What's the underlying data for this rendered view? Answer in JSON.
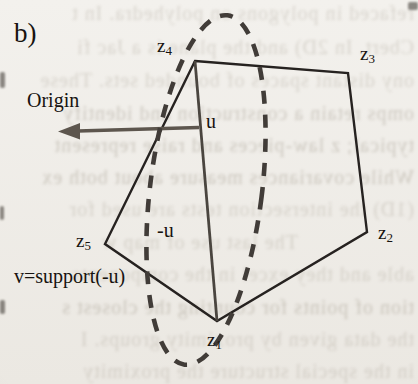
{
  "figure": {
    "panel_label": "b)",
    "origin_label": "Origin",
    "u_label": "u",
    "neg_u_label": "-u",
    "support_label": "v=support(-u)",
    "vertices": [
      {
        "letter": "z",
        "subscript": "1"
      },
      {
        "letter": "z",
        "subscript": "2"
      },
      {
        "letter": "z",
        "subscript": "3"
      },
      {
        "letter": "z",
        "subscript": "4"
      },
      {
        "letter": "z",
        "subscript": "5"
      }
    ],
    "colors": {
      "edge": "#262220",
      "diagonal": "#4a453f",
      "dash": "#413c38",
      "vector_gray": "#5d564e",
      "label": "#17130f"
    }
  },
  "background": {
    "bleed_lines": [
      "refaced in polygons on polyhedra. In t",
      "Cbert. In 2D) and the plane is a Jac fi",
      "ony distant spaces of bounded sets. These",
      "omps retain a construction and identify",
      "typical; z law-pieces and raise represent",
      "While covariances measure about both ex",
      "(1D) the intersection tests are used for",
      "The last use of map w",
      "able and they excel in the components",
      "tion of points for counting the closest s",
      "the data given by proximity groups. I",
      "in the special structure the proximity"
    ]
  }
}
